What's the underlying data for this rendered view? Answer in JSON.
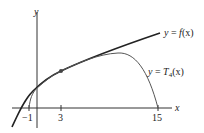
{
  "figure": {
    "axes": {
      "x_label": "x",
      "y_label": "y",
      "x_ticks": [
        {
          "label": "−1",
          "value": -1
        },
        {
          "label": "3",
          "value": 3
        },
        {
          "label": "15",
          "value": 15
        }
      ]
    },
    "curves": [
      {
        "name": "f",
        "label_prefix": "y = ",
        "label_func": "f",
        "label_arg": "(x)"
      },
      {
        "name": "T4",
        "label_prefix": "y = ",
        "label_func": "T",
        "label_sub": "4",
        "label_arg": "(x)"
      }
    ],
    "point": {
      "x": 3,
      "description": "point of tangency at x = 3"
    },
    "colors": {
      "axis": "#333333",
      "f_curve": "#222222",
      "t_curve": "#555555",
      "point": "#444444"
    }
  }
}
